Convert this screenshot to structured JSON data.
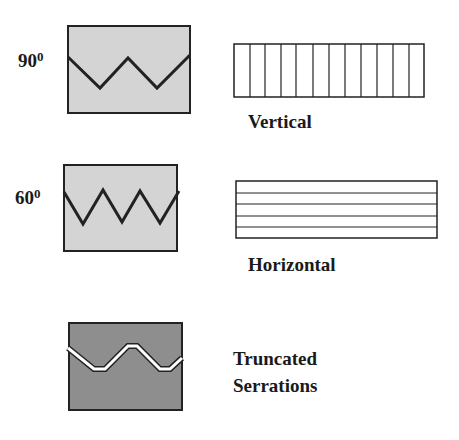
{
  "serrations": [
    {
      "angle": "90",
      "superscript": "0"
    },
    {
      "angle": "60",
      "superscript": "0"
    }
  ],
  "patterns": [
    {
      "label": "Vertical",
      "line_count": 11,
      "cells": 12
    },
    {
      "label": "Horizontal",
      "line_count": 4,
      "cells": 5
    }
  ],
  "truncated": {
    "line1": "Truncated",
    "line2": "Serrations"
  },
  "colors": {
    "light_fill": "#d4d4d4",
    "dark_fill": "#8e8e8e",
    "stroke": "#222222"
  }
}
